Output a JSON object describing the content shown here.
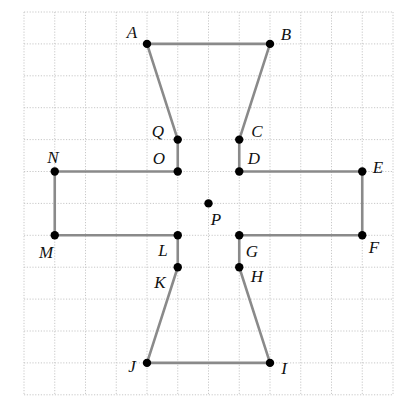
{
  "diagram": {
    "type": "grid-polygon",
    "grid": {
      "columns": 12,
      "rows": 12,
      "origin_px": [
        24,
        12
      ],
      "cell_w_px": 30.75,
      "cell_h_px": 31.9,
      "color": "#c8c8c8"
    },
    "colors": {
      "edge": "#8a8a8a",
      "vertex": "#000000",
      "label": "#111111"
    },
    "points": [
      {
        "name": "A",
        "col": 4,
        "row": 1,
        "label_px": [
          132,
          38
        ]
      },
      {
        "name": "B",
        "col": 8,
        "row": 1,
        "label_px": [
          286,
          40
        ]
      },
      {
        "name": "C",
        "col": 7,
        "row": 4,
        "label_px": [
          257,
          137
        ]
      },
      {
        "name": "D",
        "col": 7,
        "row": 5,
        "label_px": [
          254,
          164
        ]
      },
      {
        "name": "E",
        "col": 11,
        "row": 5,
        "label_px": [
          378,
          173
        ]
      },
      {
        "name": "F",
        "col": 11,
        "row": 7,
        "label_px": [
          374,
          253
        ]
      },
      {
        "name": "G",
        "col": 7,
        "row": 7,
        "label_px": [
          252,
          257
        ]
      },
      {
        "name": "H",
        "col": 7,
        "row": 8,
        "label_px": [
          257,
          282
        ]
      },
      {
        "name": "I",
        "col": 8,
        "row": 11,
        "label_px": [
          284,
          374
        ]
      },
      {
        "name": "J",
        "col": 4,
        "row": 11,
        "label_px": [
          132,
          372
        ]
      },
      {
        "name": "K",
        "col": 5,
        "row": 8,
        "label_px": [
          160,
          288
        ]
      },
      {
        "name": "L",
        "col": 5,
        "row": 7,
        "label_px": [
          163,
          256
        ]
      },
      {
        "name": "M",
        "col": 1,
        "row": 7,
        "label_px": [
          46,
          258
        ]
      },
      {
        "name": "N",
        "col": 1,
        "row": 5,
        "label_px": [
          53,
          163
        ]
      },
      {
        "name": "O",
        "col": 5,
        "row": 5,
        "label_px": [
          159,
          164
        ]
      },
      {
        "name": "Q",
        "col": 5,
        "row": 4,
        "label_px": [
          158,
          137
        ]
      },
      {
        "name": "P",
        "col": 6,
        "row": 6,
        "label_px": [
          216,
          225
        ]
      }
    ],
    "polylines": [
      [
        "Q",
        "A",
        "B",
        "C",
        "D",
        "E",
        "F",
        "G",
        "H",
        "I",
        "J",
        "K",
        "L",
        "M",
        "N",
        "O",
        "Q"
      ]
    ],
    "closed_segments_note": "Q-O and C-D vertical, G-H and L-K vertical"
  }
}
